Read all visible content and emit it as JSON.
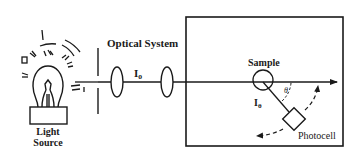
{
  "diagram": {
    "type": "light-scattering-apparatus",
    "colors": {
      "ink": "#1a1a1a",
      "background": "#ffffff"
    },
    "labels": {
      "light_source_line1": "Light",
      "light_source_line2": "Source",
      "optical_system": "Optical System",
      "incident_intensity": "I",
      "incident_intensity_sub": "o",
      "sample": "Sample",
      "scattered_intensity": "I",
      "scattered_intensity_sub": "θ",
      "angle": "θ",
      "photocell": "Photocell"
    },
    "components": [
      {
        "name": "light-source",
        "kind": "lamp"
      },
      {
        "name": "slit",
        "kind": "aperture"
      },
      {
        "name": "lens-1",
        "kind": "lens"
      },
      {
        "name": "lens-2",
        "kind": "lens"
      },
      {
        "name": "sample-chamber",
        "kind": "box"
      },
      {
        "name": "sample",
        "kind": "circle"
      },
      {
        "name": "photocell",
        "kind": "detector",
        "rotatable": true
      }
    ]
  }
}
